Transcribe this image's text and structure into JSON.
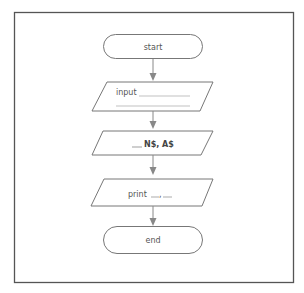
{
  "flowchart": {
    "nodes": [
      {
        "id": "start",
        "shape": "terminator",
        "label": "start"
      },
      {
        "id": "input",
        "shape": "parallelogram",
        "label": "input",
        "blank_lines": 2
      },
      {
        "id": "process",
        "shape": "parallelogram",
        "label": "N$, A$",
        "prefix_blank": "___"
      },
      {
        "id": "output",
        "shape": "parallelogram",
        "label": "print",
        "blank_suffix": "___, ___"
      },
      {
        "id": "end",
        "shape": "terminator",
        "label": "end"
      }
    ],
    "edges": [
      {
        "from": "start",
        "to": "input"
      },
      {
        "from": "input",
        "to": "process"
      },
      {
        "from": "process",
        "to": "output"
      },
      {
        "from": "output",
        "to": "end"
      }
    ]
  },
  "labels": {
    "start": "start",
    "input": "input",
    "process_vars": "N$, A$",
    "print": "print",
    "end": "end"
  },
  "colors": {
    "line": "#666666",
    "arrow": "#888888",
    "frame": "#555555",
    "text": "#555555"
  }
}
